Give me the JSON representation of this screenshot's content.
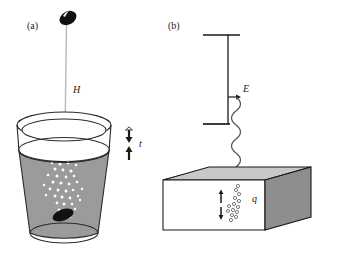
{
  "figure": {
    "panels": [
      {
        "id": "a",
        "label": "(a)",
        "annotations": {
          "height_label": "H",
          "time_label": "t"
        },
        "elements": {
          "falling_object": "dark-oval-stone",
          "container": "beaker-with-liquid",
          "liquid_color": "#9b9b9b",
          "rim_color": "#ffffff",
          "bubbles": "white-bubble-trail",
          "submerged_object": "dark-oval-stone-settled",
          "arrow_down": "down-arrow",
          "arrow_up": "up-arrow"
        }
      },
      {
        "id": "b",
        "label": "(b)",
        "annotations": {
          "field_label": "E",
          "charge_label": "q"
        },
        "elements": {
          "source": "parallel-plate-capacitor",
          "wave": "wavy-line-signal",
          "slab": "3d-rectangular-block",
          "slab_top_color": "#c8c8c8",
          "slab_front_color": "#ffffff",
          "slab_side_color": "#8e8e8e",
          "charges": "small-circle-charges",
          "arrow_up": "up-arrow",
          "arrow_down": "down-arrow"
        }
      }
    ],
    "colors": {
      "ink": "#1a1a1a",
      "liquid": "#9b9b9b",
      "slab_top": "#c8c8c8",
      "slab_side": "#8e8e8e",
      "background": "#ffffff"
    }
  }
}
